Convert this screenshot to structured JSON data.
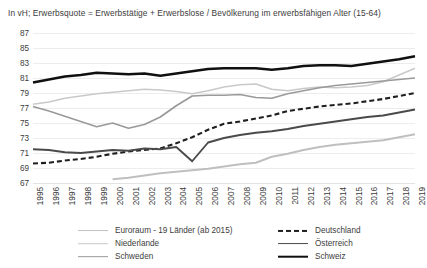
{
  "chart_title": "In vH; Erwerbsquote = Erwerbstätige + Erwerbslose / Bevölkerung im erwerbsfähigen Alter (15-64)",
  "axis": {
    "yticks": [
      "87",
      "85",
      "83",
      "81",
      "79",
      "77",
      "75",
      "73",
      "71",
      "69",
      "67"
    ],
    "xticks": [
      "1995",
      "1996",
      "1997",
      "1998",
      "1999",
      "2000",
      "2001",
      "2002",
      "2003",
      "2004",
      "2005",
      "2006",
      "2007",
      "2008",
      "2009",
      "2010",
      "2011",
      "2012",
      "2013",
      "2014",
      "2015",
      "2016",
      "2017",
      "2018",
      "2019"
    ]
  },
  "legend": {
    "left": [
      {
        "label": "Euroraum - 19 Länder (ab 2015)",
        "color": "#bfbfbf",
        "width": 1.9,
        "dash": "none"
      },
      {
        "label": "Niederlande",
        "color": "#c9c9c9",
        "width": 1.6,
        "dash": "none"
      },
      {
        "label": "Schweden",
        "color": "#9a9a9a",
        "width": 1.7,
        "dash": "none"
      }
    ],
    "right": [
      {
        "label": "Deutschland",
        "color": "#1f1f1f",
        "width": 2.1,
        "dash": "5 3"
      },
      {
        "label": "Österreich",
        "color": "#4a4a4a",
        "width": 1.9,
        "dash": "none"
      },
      {
        "label": "Schweiz",
        "color": "#101010",
        "width": 2.6,
        "dash": "none"
      }
    ]
  },
  "chart_data": {
    "type": "line",
    "title": "In vH; Erwerbsquote = Erwerbstätige + Erwerbslose / Bevölkerung im erwerbsfähigen Alter (15-64)",
    "xlabel": "",
    "ylabel": "",
    "ylim": [
      67,
      87
    ],
    "ytick_step": 2,
    "grid": true,
    "legend_position": "bottom",
    "x": [
      "1995",
      "1996",
      "1997",
      "1998",
      "1999",
      "2000",
      "2001",
      "2002",
      "2003",
      "2004",
      "2005",
      "2006",
      "2007",
      "2008",
      "2009",
      "2010",
      "2011",
      "2012",
      "2013",
      "2014",
      "2015",
      "2016",
      "2017",
      "2018",
      "2019"
    ],
    "series": [
      {
        "name": "Euroraum - 19 Länder (ab 2015)",
        "color": "#bfbfbf",
        "width": 1.9,
        "dash": "none",
        "values": [
          null,
          null,
          null,
          null,
          null,
          67.5,
          67.7,
          68.0,
          68.3,
          68.5,
          68.7,
          68.9,
          69.2,
          69.5,
          69.7,
          70.5,
          70.9,
          71.4,
          71.8,
          72.1,
          72.3,
          72.5,
          72.7,
          73.1,
          73.5
        ]
      },
      {
        "name": "Niederlande",
        "color": "#c9c9c9",
        "width": 1.6,
        "dash": "none",
        "values": [
          77.5,
          77.8,
          78.3,
          78.6,
          78.9,
          79.1,
          79.3,
          79.5,
          79.4,
          79.2,
          78.9,
          79.3,
          79.8,
          80.1,
          80.2,
          79.5,
          79.3,
          79.6,
          79.8,
          79.7,
          79.8,
          80.0,
          80.5,
          81.4,
          82.3
        ]
      },
      {
        "name": "Schweden",
        "color": "#9a9a9a",
        "width": 1.7,
        "dash": "none",
        "values": [
          77.2,
          76.6,
          75.9,
          75.2,
          74.5,
          75.0,
          74.3,
          74.8,
          75.8,
          77.3,
          78.6,
          78.7,
          78.7,
          78.8,
          78.4,
          78.3,
          78.9,
          79.3,
          79.7,
          80.0,
          80.2,
          80.4,
          80.6,
          80.8,
          81.0
        ]
      },
      {
        "name": "Deutschland",
        "color": "#1f1f1f",
        "width": 2.1,
        "dash": "5 3",
        "values": [
          69.6,
          69.7,
          70.0,
          70.2,
          70.5,
          70.9,
          71.2,
          71.4,
          71.6,
          72.3,
          73.1,
          74.1,
          74.9,
          75.2,
          75.6,
          76.0,
          76.6,
          76.9,
          77.2,
          77.4,
          77.6,
          77.9,
          78.2,
          78.6,
          79.0
        ]
      },
      {
        "name": "Österreich",
        "color": "#4a4a4a",
        "width": 1.9,
        "dash": "none",
        "values": [
          71.5,
          71.4,
          71.1,
          71.0,
          71.2,
          71.4,
          71.3,
          71.6,
          71.5,
          71.8,
          69.9,
          72.4,
          73.0,
          73.4,
          73.7,
          73.9,
          74.2,
          74.6,
          74.9,
          75.2,
          75.5,
          75.8,
          76.0,
          76.4,
          76.8
        ]
      },
      {
        "name": "Schweiz",
        "color": "#101010",
        "width": 2.6,
        "dash": "none",
        "values": [
          80.4,
          80.8,
          81.2,
          81.4,
          81.7,
          81.6,
          81.5,
          81.6,
          81.3,
          81.6,
          81.9,
          82.2,
          82.3,
          82.3,
          82.3,
          82.1,
          82.3,
          82.6,
          82.7,
          82.7,
          82.6,
          82.9,
          83.2,
          83.5,
          83.9
        ]
      }
    ]
  }
}
